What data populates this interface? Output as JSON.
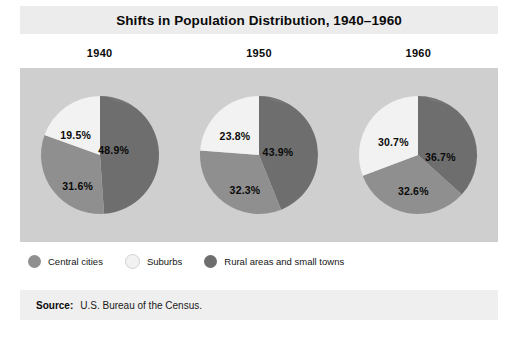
{
  "title": "Shifts in Population Distribution, 1940–1960",
  "source": {
    "label": "Source:",
    "text": "U.S. Bureau of the Census."
  },
  "legend": {
    "position": "bottom-left",
    "items": [
      {
        "label": "Central cities",
        "color": "#8f8f8f",
        "key": "central_cities"
      },
      {
        "label": "Suburbs",
        "color": "#f2f2f2",
        "key": "suburbs"
      },
      {
        "label": "Rural areas and small towns",
        "color": "#6e6e6e",
        "key": "rural_small_towns"
      }
    ]
  },
  "colors": {
    "panel_background": "#cfcfcf",
    "title_band": "#ececec",
    "source_band": "#efefef",
    "page_background": "#ffffff",
    "central_cities": "#8f8f8f",
    "suburbs": "#f2f2f2",
    "rural_small_towns": "#6e6e6e",
    "shadow_edge": "#7b7b7b",
    "text": "#0a0a0a"
  },
  "chart_data": {
    "type": "pie",
    "title": "Shifts in Population Distribution, 1940–1960",
    "subtitle": "",
    "xlabel": "",
    "ylabel": "",
    "unit": "percent",
    "grid": false,
    "legend_position": "bottom-left",
    "categories": [
      "Rural areas and small towns",
      "Central cities",
      "Suburbs"
    ],
    "panels": [
      {
        "name": "1940",
        "year": 1940,
        "slices": [
          {
            "category": "Rural areas and small towns",
            "value": 48.9,
            "label": "48.9%",
            "color": "#6e6e6e",
            "label_x": 76,
            "label_y": 57
          },
          {
            "category": "Central cities",
            "value": 31.6,
            "label": "31.6%",
            "color": "#8f8f8f",
            "label_x": 40,
            "label_y": 93
          },
          {
            "category": "Suburbs",
            "value": 19.5,
            "label": "19.5%",
            "color": "#f2f2f2",
            "label_x": 38,
            "label_y": 42
          }
        ]
      },
      {
        "name": "1950",
        "year": 1950,
        "slices": [
          {
            "category": "Rural areas and small towns",
            "value": 43.9,
            "label": "43.9%",
            "color": "#6e6e6e",
            "label_x": 81,
            "label_y": 59
          },
          {
            "category": "Central cities",
            "value": 32.3,
            "label": "32.3%",
            "color": "#8f8f8f",
            "label_x": 48,
            "label_y": 97
          },
          {
            "category": "Suburbs",
            "value": 23.8,
            "label": "23.8%",
            "color": "#f2f2f2",
            "label_x": 38,
            "label_y": 43
          }
        ]
      },
      {
        "name": "1960",
        "year": 1960,
        "slices": [
          {
            "category": "Rural areas and small towns",
            "value": 36.7,
            "label": "36.7%",
            "color": "#6e6e6e",
            "label_x": 84,
            "label_y": 64
          },
          {
            "category": "Central cities",
            "value": 32.6,
            "label": "32.6%",
            "color": "#8f8f8f",
            "label_x": 57,
            "label_y": 98
          },
          {
            "category": "Suburbs",
            "value": 30.7,
            "label": "30.7%",
            "color": "#f2f2f2",
            "label_x": 37,
            "label_y": 49
          }
        ]
      }
    ]
  }
}
